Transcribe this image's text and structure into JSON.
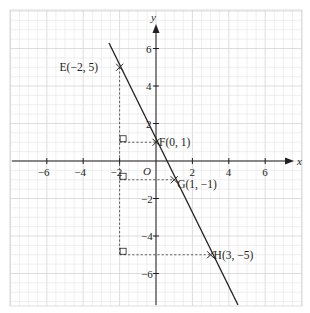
{
  "figure": {
    "axes": {
      "x_label": "x",
      "y_label": "y",
      "origin_label": "O",
      "x_ticks": [
        {
          "value": -6,
          "label": "−6"
        },
        {
          "value": -4,
          "label": "−4"
        },
        {
          "value": -2,
          "label": "−2"
        },
        {
          "value": 2,
          "label": "2"
        },
        {
          "value": 4,
          "label": "4"
        },
        {
          "value": 6,
          "label": "6"
        }
      ],
      "y_ticks": [
        {
          "value": 6,
          "label": "6"
        },
        {
          "value": 4,
          "label": "4"
        },
        {
          "value": 2,
          "label": "2"
        },
        {
          "value": -2,
          "label": "−2"
        },
        {
          "value": -4,
          "label": "−4"
        },
        {
          "value": -6,
          "label": "−6"
        }
      ]
    },
    "points": [
      {
        "name": "E",
        "x": -2,
        "y": 5,
        "label": "E(−2, 5)",
        "marker": "cross-icon"
      },
      {
        "name": "F",
        "x": 0,
        "y": 1,
        "label": "F(0, 1)",
        "marker": "cross-icon"
      },
      {
        "name": "G",
        "x": 1,
        "y": -1,
        "label": "G(1, −1)",
        "marker": "cross-icon"
      },
      {
        "name": "H",
        "x": 3,
        "y": -5,
        "label": "H(3, −5)",
        "marker": "cross-icon"
      }
    ],
    "line": {
      "equation": "y = -2x + 1",
      "slope": -2,
      "intercept": 1
    },
    "colors": {
      "ink": "#231f20",
      "grid_minor": "#e4e4e4",
      "grid_major": "#cfcfcf",
      "background": "#ffffff"
    }
  },
  "chart_data": {
    "type": "line",
    "title": "",
    "xlabel": "x",
    "ylabel": "y",
    "xlim": [
      -8,
      8
    ],
    "ylim": [
      -8,
      7.5
    ],
    "grid": true,
    "series": [
      {
        "name": "y = -2x + 1",
        "x": [
          -2.6,
          4.6
        ],
        "y": [
          6.2,
          -8.0
        ]
      }
    ],
    "annotations": [
      {
        "text": "E(−2, 5)",
        "x": -2,
        "y": 5
      },
      {
        "text": "F(0, 1)",
        "x": 0,
        "y": 1
      },
      {
        "text": "G(1, −1)",
        "x": 1,
        "y": -1
      },
      {
        "text": "H(3, −5)",
        "x": 3,
        "y": -5
      },
      {
        "text": "O",
        "x": 0,
        "y": 0
      }
    ],
    "guides": [
      {
        "type": "dashed-vertical",
        "x": -2,
        "from_y": -5,
        "to_y": 5
      },
      {
        "type": "dashed-horizontal",
        "y": 1,
        "from_x": -2,
        "to_x": 0
      },
      {
        "type": "dashed-horizontal",
        "y": -1,
        "from_x": -2,
        "to_x": 1
      },
      {
        "type": "dashed-horizontal",
        "y": -5,
        "from_x": -2,
        "to_x": 3
      },
      {
        "type": "right-angle-markers",
        "at": [
          [
            -2,
            1
          ],
          [
            -2,
            -1
          ],
          [
            -2,
            -5
          ]
        ]
      }
    ]
  }
}
